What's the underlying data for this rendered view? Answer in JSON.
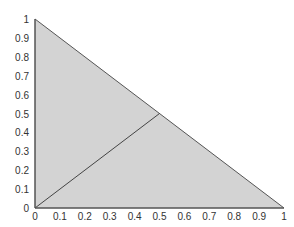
{
  "chart_data": {
    "type": "area",
    "title": "",
    "xlabel": "",
    "ylabel": "",
    "xlim": [
      0,
      1
    ],
    "ylim": [
      0,
      1
    ],
    "grid": false,
    "legend": null,
    "x_ticks": [
      "0",
      "0.1",
      "0.2",
      "0.3",
      "0.4",
      "0.5",
      "0.6",
      "0.7",
      "0.8",
      "0.9",
      "1"
    ],
    "y_ticks": [
      "0",
      "0.1",
      "0.2",
      "0.3",
      "0.4",
      "0.5",
      "0.6",
      "0.7",
      "0.8",
      "0.9",
      "1"
    ],
    "series": [
      {
        "name": "feasible-region",
        "kind": "filled-triangle",
        "points": [
          [
            0,
            0
          ],
          [
            0,
            1
          ],
          [
            1,
            0
          ]
        ],
        "fill": "#d3d3d3",
        "stroke": "#555555"
      },
      {
        "name": "diagonal-segment",
        "kind": "line",
        "points": [
          [
            0,
            0
          ],
          [
            0.5,
            0.5
          ]
        ],
        "stroke": "#444444"
      }
    ]
  },
  "colors": {
    "fill": "#d3d3d3",
    "line": "#555555",
    "text": "#333333"
  }
}
